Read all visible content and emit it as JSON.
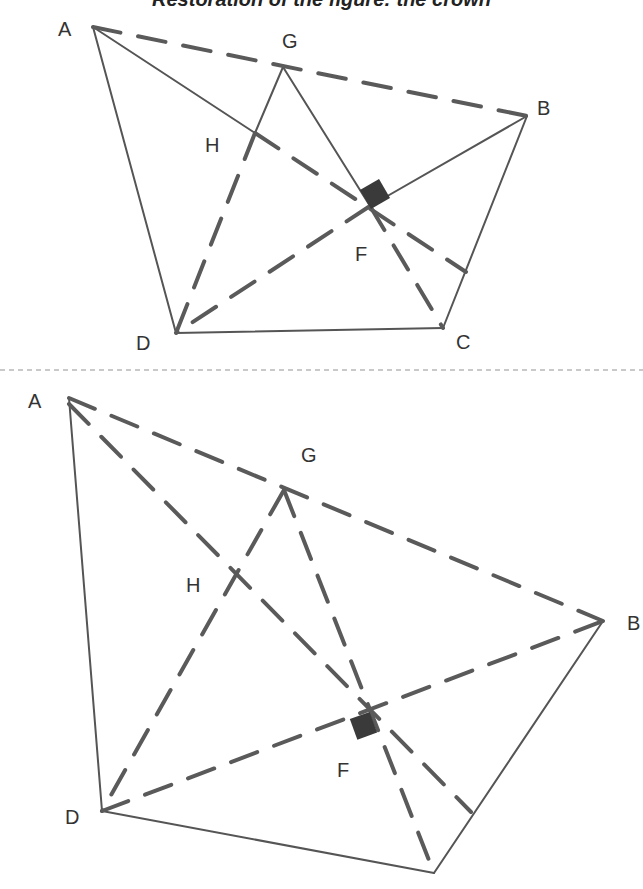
{
  "title": "Restoration of the figure: the crown",
  "colors": {
    "line": "#555555",
    "dashed": "#5a5a5a",
    "marker": "#3a3a3a",
    "divider": "#b8b8b8"
  },
  "top_figure": {
    "labels": {
      "A": "A",
      "B": "B",
      "C": "C",
      "D": "D",
      "F": "F",
      "G": "G",
      "H": "H"
    },
    "points": {
      "A": [
        93,
        27
      ],
      "B": [
        527,
        116
      ],
      "C": [
        443,
        328
      ],
      "D": [
        176,
        333
      ],
      "F": [
        370,
        206
      ],
      "G": [
        283,
        67
      ],
      "H": [
        255,
        133
      ],
      "E": [
        466,
        272
      ]
    }
  },
  "bottom_figure": {
    "labels": {
      "A": "A",
      "B": "B",
      "D": "D",
      "F": "F",
      "G": "G",
      "H": "H"
    },
    "points": {
      "A": [
        69,
        398
      ],
      "B": [
        603,
        621
      ],
      "C": [
        434,
        873
      ],
      "D": [
        102,
        811
      ],
      "F": [
        367,
        708
      ],
      "G": [
        284,
        490
      ],
      "H": [
        230,
        573
      ],
      "E": [
        471,
        812
      ]
    }
  }
}
